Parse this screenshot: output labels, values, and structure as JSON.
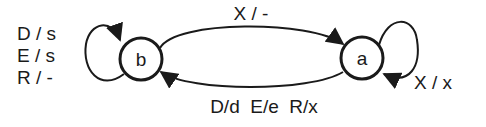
{
  "diagram": {
    "type": "state-machine",
    "colors": {
      "stroke": "#1a1a1a",
      "background": "#ffffff"
    },
    "states": [
      {
        "id": "b",
        "label": "b"
      },
      {
        "id": "a",
        "label": "a"
      }
    ],
    "transitions": [
      {
        "from": "b",
        "to": "a",
        "label": "X / -"
      },
      {
        "from": "a",
        "to": "b",
        "label": "D/d  E/e  R/x"
      },
      {
        "from": "b",
        "to": "b",
        "labels": [
          "D / s",
          "E / s",
          "R / -"
        ]
      },
      {
        "from": "a",
        "to": "a",
        "label": "X / x"
      }
    ]
  }
}
